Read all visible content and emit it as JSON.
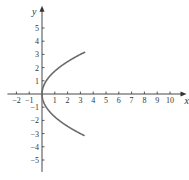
{
  "chart_data": {
    "type": "line",
    "title": "",
    "xlabel": "x",
    "ylabel": "y",
    "xlim": [
      -2,
      10
    ],
    "ylim": [
      -5,
      5
    ],
    "x_ticks": [
      -2,
      -1,
      1,
      2,
      3,
      4,
      5,
      6,
      7,
      8,
      9,
      10
    ],
    "y_ticks": [
      -5,
      -4,
      -3,
      -2,
      -1,
      1,
      2,
      3,
      4,
      5
    ],
    "grid": false,
    "legend": null,
    "series": [
      {
        "name": "x = y^2/3 (parabola opening right)",
        "color": "#6b6b6b",
        "points": [
          [
            10,
            3.16
          ],
          [
            8,
            2.83
          ],
          [
            6,
            2.45
          ],
          [
            4,
            2.0
          ],
          [
            3,
            1.73
          ],
          [
            2,
            1.41
          ],
          [
            1,
            1.0
          ],
          [
            0.5,
            0.71
          ],
          [
            0.2,
            0.45
          ],
          [
            0,
            0
          ],
          [
            0.2,
            -0.45
          ],
          [
            0.5,
            -0.71
          ],
          [
            1,
            -1.0
          ],
          [
            2,
            -1.41
          ],
          [
            3,
            -1.73
          ],
          [
            4,
            -2.0
          ],
          [
            6,
            -2.45
          ],
          [
            8,
            -2.83
          ],
          [
            10,
            -3.16
          ]
        ]
      }
    ]
  },
  "axes": {
    "x_label": "x",
    "y_label": "y"
  }
}
